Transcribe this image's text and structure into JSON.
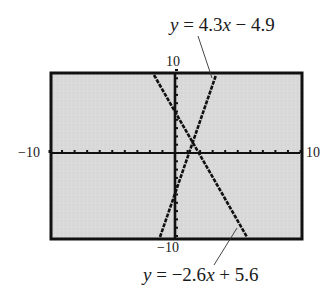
{
  "chart_data": {
    "type": "line",
    "title": "",
    "xlabel": "",
    "ylabel": "",
    "xlim": [
      -10,
      10
    ],
    "ylim": [
      -10,
      10
    ],
    "grid": false,
    "tick_labels": {
      "x_min": "−10",
      "x_max": "10",
      "y_min": "−10",
      "y_max": "10"
    },
    "series": [
      {
        "name": "y = 4.3x − 4.9",
        "slope": 4.3,
        "intercept": -4.9,
        "x": [
          -1.19,
          3.47
        ],
        "y": [
          -10,
          10
        ]
      },
      {
        "name": "y = −2.6x + 5.6",
        "slope": -2.6,
        "intercept": 5.6,
        "x": [
          -1.69,
          6.0
        ],
        "y": [
          10,
          -10
        ]
      }
    ],
    "annotations": [
      {
        "text": "y = 4.3x − 4.9",
        "position": "top-right",
        "points_to": "line 1"
      },
      {
        "text": "y = −2.6x + 5.6",
        "position": "bottom",
        "points_to": "line 2"
      }
    ],
    "style": {
      "screen_background": "#d9d9d9",
      "frame_color": "#111111",
      "line_color": "#111111"
    }
  },
  "labels": {
    "y_max": "10",
    "y_min": "−10",
    "x_min": "−10",
    "x_max": "10"
  },
  "equations": {
    "line1": {
      "y": "y",
      "rest1": " = 4.3",
      "x": "x",
      "rest2": " − 4.9"
    },
    "line2": {
      "y": "y",
      "rest1": " = −2.6",
      "x": "x",
      "rest2": " + 5.6"
    }
  }
}
